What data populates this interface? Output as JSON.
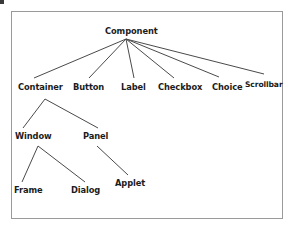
{
  "diagram": {
    "type": "class-hierarchy-tree",
    "title": "",
    "colors": {
      "frame_border": "#9a9a9a",
      "edge": "#4a4a4a",
      "text": "#1c1c1c",
      "background": "#ffffff"
    },
    "nodes": [
      {
        "id": "component",
        "label": "Component",
        "level": 0,
        "x": 105,
        "y": 26,
        "w": 54
      },
      {
        "id": "container",
        "label": "Container",
        "level": 1,
        "x": 18,
        "y": 82,
        "w": 45
      },
      {
        "id": "button",
        "label": "Button",
        "level": 1,
        "x": 73,
        "y": 82,
        "w": 33
      },
      {
        "id": "label",
        "label": "Label",
        "level": 1,
        "x": 121,
        "y": 82,
        "w": 27
      },
      {
        "id": "checkbox",
        "label": "Checkbox",
        "level": 1,
        "x": 158,
        "y": 82,
        "w": 43
      },
      {
        "id": "choice",
        "label": "Choice",
        "level": 1,
        "x": 212,
        "y": 82,
        "w": 30
      },
      {
        "id": "scrollbar",
        "label": "Scrollbar",
        "level": 1,
        "x": 245,
        "y": 80,
        "w": 39
      },
      {
        "id": "window",
        "label": "Window",
        "level": 2,
        "x": 15,
        "y": 131,
        "w": 38
      },
      {
        "id": "panel",
        "label": "Panel",
        "level": 2,
        "x": 83,
        "y": 131,
        "w": 27
      },
      {
        "id": "frame",
        "label": "Frame",
        "level": 3,
        "x": 14,
        "y": 185,
        "w": 31
      },
      {
        "id": "dialog",
        "label": "Dialog",
        "level": 3,
        "x": 71,
        "y": 185,
        "w": 30
      },
      {
        "id": "applet",
        "label": "Applet",
        "level": 3,
        "x": 115,
        "y": 178,
        "w": 31
      }
    ],
    "edges": [
      {
        "from": "component",
        "to": "container",
        "x1": 126,
        "y1": 39,
        "x2": 34,
        "y2": 78
      },
      {
        "from": "component",
        "to": "button",
        "x1": 126,
        "y1": 39,
        "x2": 89,
        "y2": 78
      },
      {
        "from": "component",
        "to": "label",
        "x1": 126,
        "y1": 39,
        "x2": 134,
        "y2": 78
      },
      {
        "from": "component",
        "to": "checkbox",
        "x1": 126,
        "y1": 39,
        "x2": 174,
        "y2": 78
      },
      {
        "from": "component",
        "to": "choice",
        "x1": 126,
        "y1": 39,
        "x2": 219,
        "y2": 77
      },
      {
        "from": "component",
        "to": "scrollbar",
        "x1": 126,
        "y1": 39,
        "x2": 264,
        "y2": 74
      },
      {
        "from": "container",
        "to": "window",
        "x1": 45,
        "y1": 99,
        "x2": 23,
        "y2": 128
      },
      {
        "from": "container",
        "to": "panel",
        "x1": 45,
        "y1": 99,
        "x2": 98,
        "y2": 128
      },
      {
        "from": "window",
        "to": "frame",
        "x1": 38,
        "y1": 146,
        "x2": 22,
        "y2": 182
      },
      {
        "from": "window",
        "to": "dialog",
        "x1": 38,
        "y1": 146,
        "x2": 85,
        "y2": 182
      },
      {
        "from": "panel",
        "to": "applet",
        "x1": 97,
        "y1": 146,
        "x2": 128,
        "y2": 175
      }
    ],
    "frame": {
      "x": 11,
      "y": 11,
      "w": 272,
      "h": 208
    }
  }
}
